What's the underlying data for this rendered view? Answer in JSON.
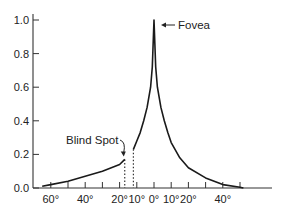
{
  "chart_data": {
    "type": "line",
    "title": "",
    "xlabel": "",
    "ylabel": "",
    "ylim": [
      0.0,
      1.0
    ],
    "xlim": [
      -65,
      52
    ],
    "grid": false,
    "legend": null,
    "y_ticks": [
      0.0,
      0.2,
      0.4,
      0.6,
      0.8,
      1.0
    ],
    "y_tick_labels": [
      "0.0",
      "0.2",
      "0.4",
      "0.6",
      "0.8",
      "1.0"
    ],
    "x_ticks": [
      -60,
      -50,
      -40,
      -30,
      -20,
      -10,
      0,
      10,
      20,
      30,
      40,
      50
    ],
    "x_tick_labels": [
      {
        "value": -60,
        "label": "60°"
      },
      {
        "value": -40,
        "label": "40°"
      },
      {
        "value": -20,
        "label": "20°"
      },
      {
        "value": -10,
        "label": "10°"
      },
      {
        "value": 0,
        "label": "0°"
      },
      {
        "value": 10,
        "label": "10°"
      },
      {
        "value": 20,
        "label": "20°"
      },
      {
        "value": 40,
        "label": "40°"
      }
    ],
    "series": [
      {
        "name": "Visual acuity (temporal side)",
        "x": [
          -65,
          -60,
          -50,
          -40,
          -30,
          -20,
          -17
        ],
        "y": [
          0.01,
          0.02,
          0.04,
          0.07,
          0.1,
          0.14,
          0.17
        ]
      },
      {
        "name": "Visual acuity (central)",
        "x": [
          -12,
          -10,
          -8,
          -6,
          -4,
          -2,
          -1,
          0,
          1,
          2,
          4,
          6,
          8,
          10,
          15,
          20,
          30,
          40,
          50,
          52
        ],
        "y": [
          0.23,
          0.28,
          0.33,
          0.4,
          0.48,
          0.6,
          0.72,
          1.0,
          0.72,
          0.6,
          0.48,
          0.4,
          0.33,
          0.27,
          0.18,
          0.12,
          0.06,
          0.02,
          0.005,
          0.0
        ]
      }
    ],
    "annotations": [
      {
        "text": "Fovea",
        "x": 0,
        "y": 1.0,
        "arrow": true
      },
      {
        "text": "Blind Spot",
        "x": -17,
        "y": 0.17,
        "arrow": true,
        "dotted_lines_at_x": [
          -17,
          -12
        ]
      }
    ]
  }
}
